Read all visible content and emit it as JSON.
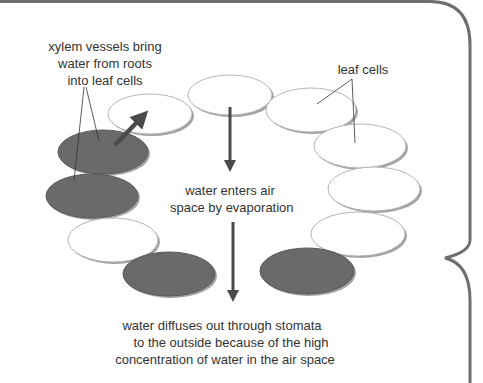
{
  "diagram": {
    "labels": {
      "xylem": [
        "xylem vessels bring",
        "water from roots",
        "into leaf cells"
      ],
      "leaf_cells": "leaf cells",
      "evaporation": [
        "water enters air",
        "space by evaporation"
      ],
      "diffusion": [
        "water diffuses out through stomata",
        "to the outside because of the high",
        "concentration of water in the air space"
      ]
    },
    "colors": {
      "dark_cell": "#6a6a6a",
      "light_cell": "#ffffff",
      "outline": "#b5b5b5",
      "shadow": "#555555",
      "arrow": "#4a4a4a",
      "frame": "#6e6e6e",
      "text": "#333333"
    },
    "cells": [
      {
        "id": "top-center",
        "type": "leaf-cell",
        "cx": 230,
        "cy": 95,
        "rx": 42,
        "ry": 20
      },
      {
        "id": "upper-left",
        "type": "leaf-cell",
        "cx": 150,
        "cy": 114,
        "rx": 42,
        "ry": 20
      },
      {
        "id": "xylem-1",
        "type": "xylem-vessel",
        "cx": 103,
        "cy": 152,
        "rx": 45,
        "ry": 22
      },
      {
        "id": "xylem-2",
        "type": "xylem-vessel",
        "cx": 92,
        "cy": 196,
        "rx": 46,
        "ry": 22
      },
      {
        "id": "lower-left",
        "type": "leaf-cell",
        "cx": 113,
        "cy": 240,
        "rx": 45,
        "ry": 22
      },
      {
        "id": "xylem-3",
        "type": "xylem-vessel",
        "cx": 169,
        "cy": 274,
        "rx": 46,
        "ry": 22
      },
      {
        "id": "right-1",
        "type": "leaf-cell",
        "cx": 311,
        "cy": 110,
        "rx": 45,
        "ry": 22
      },
      {
        "id": "right-2",
        "type": "leaf-cell",
        "cx": 360,
        "cy": 146,
        "rx": 46,
        "ry": 22
      },
      {
        "id": "right-3",
        "type": "leaf-cell",
        "cx": 374,
        "cy": 189,
        "rx": 46,
        "ry": 22
      },
      {
        "id": "right-4",
        "type": "leaf-cell",
        "cx": 358,
        "cy": 234,
        "rx": 47,
        "ry": 22
      },
      {
        "id": "xylem-4",
        "type": "xylem-vessel",
        "cx": 307,
        "cy": 271,
        "rx": 47,
        "ry": 23
      }
    ]
  }
}
